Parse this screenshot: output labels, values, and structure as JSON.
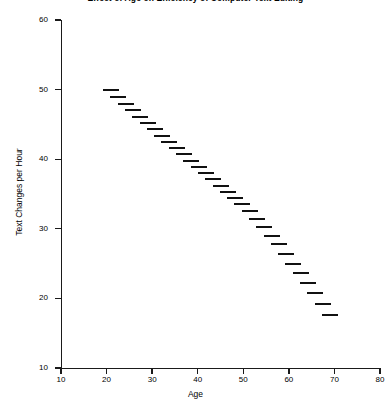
{
  "chart_data": {
    "type": "scatter",
    "title": "Effect of Age on Efficiency of Computer Text Editing",
    "xlabel": "Age",
    "ylabel": "Text Changes per Hour",
    "xlim": [
      10,
      80
    ],
    "ylim": [
      10,
      60
    ],
    "xticks": [
      "10",
      "20",
      "30",
      "40",
      "50",
      "60",
      "70",
      "80"
    ],
    "xtick_values": [
      10,
      20,
      30,
      40,
      50,
      60,
      70,
      80
    ],
    "yticks": [
      "10",
      "20",
      "30",
      "40",
      "50",
      "60"
    ],
    "ytick_values": [
      10,
      20,
      30,
      40,
      50,
      60
    ],
    "grid": false,
    "legend": null,
    "marker": "horizontal-dash",
    "marker_color": "#111111",
    "x": [
      21.0,
      22.6,
      24.2,
      25.8,
      27.4,
      29.0,
      30.6,
      32.2,
      33.8,
      35.4,
      37.0,
      38.6,
      40.2,
      41.8,
      43.4,
      45.0,
      46.6,
      48.2,
      49.8,
      51.4,
      53.0,
      54.6,
      56.2,
      57.8,
      59.4,
      61.0,
      62.6,
      64.2,
      65.8,
      67.4,
      69.0
    ],
    "y": [
      50.0,
      49.0,
      48.0,
      47.0,
      46.1,
      45.2,
      44.3,
      43.4,
      42.5,
      41.6,
      40.7,
      39.8,
      38.9,
      38.0,
      37.1,
      36.2,
      35.3,
      34.4,
      33.5,
      32.6,
      31.4,
      30.2,
      29.0,
      27.8,
      26.4,
      25.0,
      23.6,
      22.2,
      20.8,
      19.2,
      17.6
    ],
    "trend": "negative-linear",
    "n_points": 31
  }
}
